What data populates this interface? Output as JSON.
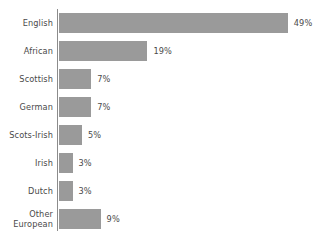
{
  "chart_data": {
    "type": "bar",
    "orientation": "horizontal",
    "title": "",
    "subtitle": "",
    "xlabel": "",
    "ylabel": "",
    "grid": false,
    "legend": false,
    "axis_ticks": false,
    "xlim": [
      0,
      49
    ],
    "value_suffix": "%",
    "categories": [
      "English",
      "African",
      "Scottish",
      "German",
      "Scots-Irish",
      "Irish",
      "Dutch",
      "Other\nEuropean"
    ],
    "values": [
      49,
      19,
      7,
      7,
      5,
      3,
      3,
      9
    ],
    "data_labels": [
      "49%",
      "19%",
      "7%",
      "7%",
      "5%",
      "3%",
      "3%",
      "9%"
    ],
    "colors": {
      "bar": "#9a9a9a",
      "axis": "#8c8c8c",
      "text": "#4a4a4a",
      "background": "#ffffff"
    }
  }
}
